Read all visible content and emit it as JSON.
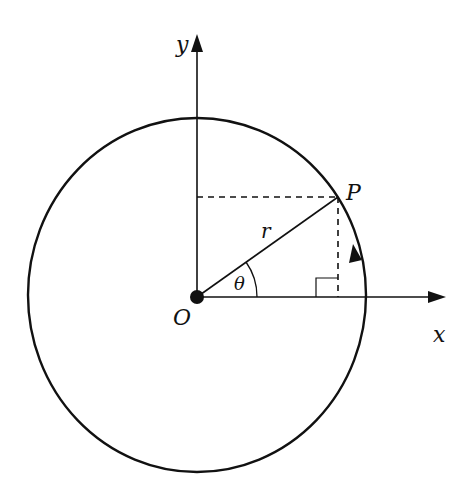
{
  "diagram": {
    "labels": {
      "x_axis": "x",
      "y_axis": "y",
      "origin": "O",
      "point": "P",
      "radius": "r",
      "angle": "θ"
    },
    "colors": {
      "stroke": "#111111",
      "background": "#ffffff"
    },
    "geometry": {
      "origin": [
        197,
        297
      ],
      "point_P": [
        338,
        197
      ],
      "circle_center": [
        197,
        295
      ],
      "circle_rx": 169,
      "circle_ry": 177,
      "direction": "anticlockwise"
    }
  }
}
